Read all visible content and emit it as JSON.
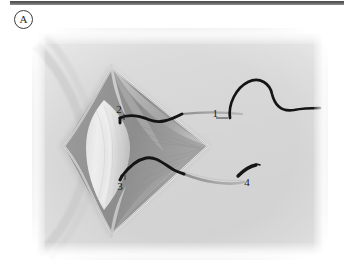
{
  "panel": {
    "letter": "A",
    "letter_icon": "circled-letter-a"
  },
  "header": {
    "rule_color": "#545454"
  },
  "figure": {
    "type": "surgical-illustration",
    "background_color": "#dcdcdc",
    "page_color": "#ffffff",
    "tissue_color": "#b9b9b9",
    "suture_color": "#111111",
    "thread_color": "#9a9a9a",
    "needle_color": "#1a1a1a",
    "callouts": [
      {
        "id": "1",
        "label": "1",
        "name": "suture-strand-free-end",
        "x": 188,
        "y": 86,
        "lead_from_x": 182,
        "lead_to_x": 150
      },
      {
        "id": "2",
        "label": "2",
        "name": "upper-suture-knot",
        "x": 86,
        "y": 88,
        "lead_from_x": 90,
        "lead_to_x": 92
      },
      {
        "id": "3",
        "label": "3",
        "name": "lower-suture-knot",
        "x": 87,
        "y": 146,
        "lead_from_x": 90,
        "lead_to_x": 92
      },
      {
        "id": "4",
        "label": "4",
        "name": "curved-needle",
        "x": 216,
        "y": 142,
        "lead_from_x": 214,
        "lead_to_x": 206
      }
    ]
  }
}
